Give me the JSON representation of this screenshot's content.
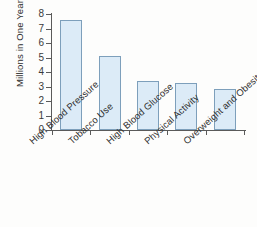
{
  "chart_data": {
    "type": "bar",
    "title": "",
    "xlabel": "",
    "ylabel": "Millions in One Year",
    "categories": [
      "High Blood Pressure",
      "Tobacco Use",
      "High Blood Glucose",
      "Physical Activity",
      "Overweight and Obesity"
    ],
    "values": [
      7.6,
      5.1,
      3.4,
      3.25,
      2.8
    ],
    "ylim": [
      0,
      8
    ],
    "yticks": [
      "0",
      "1",
      "2",
      "3",
      "4",
      "5",
      "6",
      "7",
      "8"
    ],
    "ytick_values": [
      0,
      1,
      2,
      3,
      4,
      5,
      6,
      7,
      8
    ],
    "grid": false,
    "legend": false,
    "bar_fill_color": "#dcebf7",
    "bar_border_color": "#7d9fbb",
    "axis_color": "#5a5a5a",
    "background_color": "#fdfdfc"
  }
}
